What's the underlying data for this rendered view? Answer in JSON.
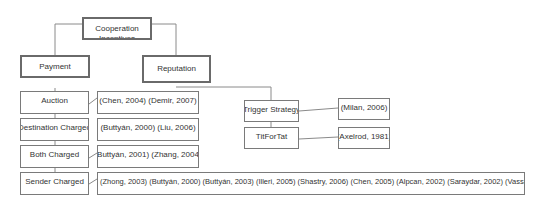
{
  "diagram": {
    "root": {
      "label": "Cooperation Incentives"
    },
    "categories": [
      {
        "id": "payment",
        "label": "Payment"
      },
      {
        "id": "reputation",
        "label": "Reputation"
      }
    ],
    "payment_schemes": [
      {
        "label": "Auction",
        "refs": "(Chen, 2004) (Demir, 2007)"
      },
      {
        "label": "Destination Charged",
        "refs": "(Buttyán, 2000) (Liu, 2006)"
      },
      {
        "label": "Both Charged",
        "refs": "(Buttyán, 2001) (Zhang, 2004)"
      },
      {
        "label": "Sender Charged",
        "refs": "(Zhong, 2003) (Buttyán, 2000) (Buttyán, 2003) (Illeri, 2005) (Shastry, 2006) (Chen, 2005) (Alpcan, 2002) (Saraydar, 2002) (Vassaki, 2009)"
      }
    ],
    "reputation_schemes": [
      {
        "label": "Trigger Strategy",
        "refs": "(Milan, 2006)"
      },
      {
        "label": "TitForTat",
        "refs": "(Axelrod, 1981)"
      }
    ]
  }
}
